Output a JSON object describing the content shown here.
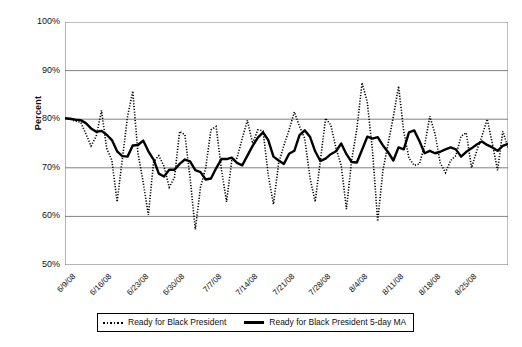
{
  "chart_data": {
    "type": "line",
    "title": "",
    "xlabel": "",
    "ylabel": "Percent",
    "ylim": [
      50,
      100
    ],
    "ytick_labels": [
      "100%",
      "90%",
      "80%",
      "70%",
      "60%",
      "50%"
    ],
    "ytick_values": [
      100,
      90,
      80,
      70,
      60,
      50
    ],
    "ytick_suffix": "%",
    "grid": true,
    "grid_axis": "y",
    "legend_position": "bottom-center",
    "xtick_labels": [
      "6/9/08",
      "6/16/08",
      "6/23/08",
      "6/30/08",
      "7/7/08",
      "7/14/08",
      "7/21/08",
      "7/28/08",
      "8/4/08",
      "8/11/08",
      "8/18/08",
      "8/25/08"
    ],
    "x_start": "6/9/08",
    "x_end": "8/27/08",
    "x_interval_days": 1,
    "xtick_interval_days": 7,
    "series": [
      {
        "name": "Ready for Black President",
        "style": "dotted",
        "color": "#000000",
        "values": [
          80.2,
          80.0,
          79.6,
          79.4,
          77.0,
          74.5,
          76.5,
          81.8,
          74.0,
          71.5,
          63.0,
          71.8,
          80.5,
          85.8,
          73.0,
          67.0,
          60.3,
          71.2,
          72.5,
          70.3,
          66.0,
          68.0,
          77.5,
          76.8,
          68.0,
          57.3,
          66.0,
          70.0,
          77.8,
          78.5,
          69.8,
          63.0,
          71.5,
          72.0,
          76.0,
          79.8,
          75.0,
          77.8,
          77.6,
          68.5,
          62.5,
          71.0,
          74.6,
          77.8,
          81.5,
          78.5,
          76.0,
          68.0,
          63.0,
          71.5,
          80.2,
          78.8,
          74.0,
          70.5,
          61.5,
          71.5,
          78.0,
          87.5,
          83.5,
          73.5,
          59.0,
          69.5,
          75.0,
          80.5,
          86.8,
          77.5,
          72.0,
          70.5,
          70.8,
          74.5,
          80.6,
          77.0,
          71.0,
          69.0,
          71.5,
          72.5,
          76.5,
          77.2,
          70.0,
          73.5,
          76.5,
          80.0,
          75.0,
          69.5,
          77.5,
          74.2
        ]
      },
      {
        "name": "Ready for Black President 5-day MA",
        "style": "solid",
        "color": "#000000",
        "values": [
          80.2,
          80.1,
          79.9,
          79.8,
          79.2,
          78.1,
          77.4,
          77.6,
          76.8,
          75.7,
          73.4,
          72.4,
          72.3,
          74.6,
          74.7,
          75.6,
          73.4,
          71.7,
          68.8,
          68.2,
          69.6,
          69.6,
          70.8,
          71.7,
          71.3,
          69.5,
          69.1,
          67.6,
          67.8,
          69.9,
          71.8,
          71.8,
          72.1,
          71.0,
          70.5,
          72.5,
          74.5,
          76.2,
          77.3,
          75.7,
          72.3,
          71.5,
          70.8,
          72.9,
          73.5,
          76.7,
          77.7,
          76.4,
          73.4,
          71.4,
          71.9,
          72.8,
          73.4,
          75.0,
          72.8,
          71.2,
          71.1,
          73.7,
          76.4,
          76.0,
          76.3,
          74.6,
          73.2,
          71.5,
          74.2,
          73.8,
          77.3,
          77.7,
          75.5,
          73.0,
          73.5,
          73.0,
          73.3,
          73.8,
          74.2,
          73.8,
          72.3,
          73.3,
          74.0,
          74.8,
          75.4,
          74.7,
          74.2,
          73.5,
          74.5,
          74.9
        ]
      }
    ]
  },
  "legend": {
    "items": [
      {
        "label": "Ready for Black President",
        "style": "dotted"
      },
      {
        "label": "Ready for Black President 5-day MA",
        "style": "solid"
      }
    ]
  },
  "colors": {
    "plot_border": "#7f7f7f",
    "gridline": "#808080",
    "series": "#000000",
    "text": "#111111",
    "background": "#ffffff"
  }
}
